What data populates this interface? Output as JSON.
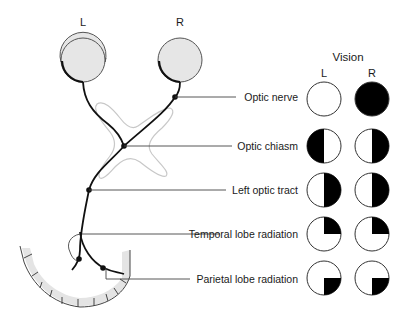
{
  "eyes": {
    "left_label": "L",
    "right_label": "R"
  },
  "vision": {
    "title": "Vision",
    "col_left": "L",
    "col_right": "R"
  },
  "lesions": [
    {
      "label": "Optic nerve",
      "left_field": "full",
      "right_field": "blind"
    },
    {
      "label": "Optic chiasm",
      "left_field": "left-half-blind",
      "right_field": "right-half-blind"
    },
    {
      "label": "Left optic tract",
      "left_field": "right-half-blind",
      "right_field": "right-half-blind"
    },
    {
      "label": "Temporal lobe radiation",
      "left_field": "upper-right-quadrant-blind",
      "right_field": "upper-right-quadrant-blind"
    },
    {
      "label": "Parietal lobe radiation",
      "left_field": "lower-right-quadrant-blind",
      "right_field": "lower-right-quadrant-blind"
    }
  ],
  "colors": {
    "eye_fill": "#e6e6e6",
    "chiasm_outline": "#c8c8c8",
    "cortex_fill": "#e4e4e4",
    "pathway": "#111111"
  }
}
